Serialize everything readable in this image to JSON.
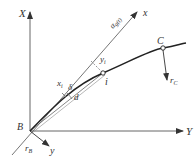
{
  "diagram": {
    "colors": {
      "line": "#555555",
      "text": "#333333",
      "background": "#ffffff"
    },
    "labels": {
      "X_axis": "X",
      "Y_axis": "Y",
      "x_axis": "x",
      "y_axis": "y",
      "origin": "B",
      "point_C": "C",
      "point_i": "i",
      "angle": "α",
      "angle_sub": "g(t)",
      "x_i": "x",
      "x_i_sub": "i",
      "y_i": "y",
      "y_i_sub": "i",
      "delta": "δ",
      "chord": "d",
      "r_B": "r",
      "r_B_sub": "B",
      "r_C": "r",
      "r_C_sub": "C"
    }
  }
}
